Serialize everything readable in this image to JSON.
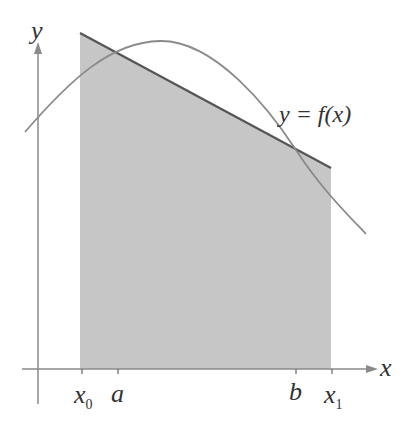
{
  "diagram": {
    "title": "",
    "axis_labels": {
      "x": "x",
      "y": "y"
    },
    "curve_label": "y = f(x)",
    "tick_labels": [
      {
        "id": "x0",
        "base": "x",
        "sub": "0"
      },
      {
        "id": "a",
        "base": "a",
        "sub": ""
      },
      {
        "id": "b",
        "base": "b",
        "sub": ""
      },
      {
        "id": "x1",
        "base": "x",
        "sub": "1"
      }
    ],
    "colors": {
      "shade": "#c6c6c6",
      "secant_line": "#555555",
      "curve": "#8a8a8a",
      "axes": "#8a8a8a",
      "text": "#333333"
    }
  }
}
